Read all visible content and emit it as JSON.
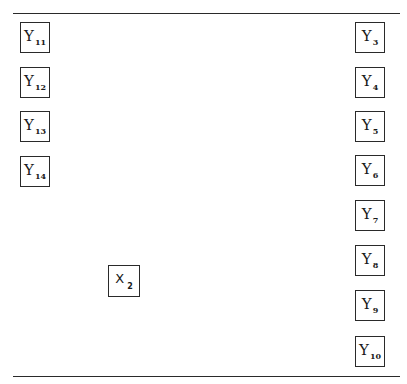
{
  "diagram": {
    "left_variables": [
      {
        "name": "Y",
        "sub": "11"
      },
      {
        "name": "Y",
        "sub": "12"
      },
      {
        "name": "Y",
        "sub": "13"
      },
      {
        "name": "Y",
        "sub": "14"
      }
    ],
    "right_variables": [
      {
        "name": "Y",
        "sub": "3"
      },
      {
        "name": "Y",
        "sub": "4"
      },
      {
        "name": "Y",
        "sub": "5"
      },
      {
        "name": "Y",
        "sub": "6"
      },
      {
        "name": "Y",
        "sub": "7"
      },
      {
        "name": "Y",
        "sub": "8"
      },
      {
        "name": "Y",
        "sub": "9"
      },
      {
        "name": "Y",
        "sub": "10"
      }
    ],
    "center_variable": {
      "name": "X",
      "sub": "2"
    }
  }
}
